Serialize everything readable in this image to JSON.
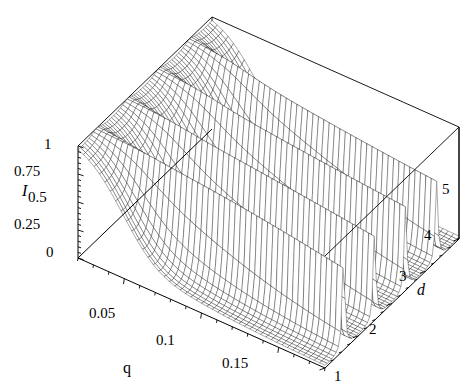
{
  "figure": {
    "type": "surface3d-wireframe",
    "background": "#ffffff",
    "line_color": "#000000",
    "fill_color": "#ffffff"
  },
  "axes": {
    "vertical": {
      "title": "I",
      "title_style": "italic",
      "ticks": [
        "0",
        "0.25",
        "0.5",
        "0.75",
        "1"
      ],
      "values": [
        0,
        0.25,
        0.5,
        0.75,
        1
      ],
      "range": [
        0,
        1
      ]
    },
    "left_depth": {
      "title": "q",
      "title_style": "upright",
      "ticks": [
        "0.05",
        "0.1",
        "0.15"
      ],
      "values": [
        0.05,
        0.1,
        0.15
      ],
      "range": [
        0.02,
        0.18
      ]
    },
    "right_depth": {
      "title": "d",
      "title_style": "italic",
      "ticks": [
        "1",
        "2",
        "3",
        "4",
        "5"
      ],
      "values": [
        1,
        2,
        3,
        4,
        5
      ],
      "range": [
        1,
        5
      ]
    }
  },
  "tick_labels": {
    "I": [
      {
        "text": "1",
        "x": 44,
        "y": 137
      },
      {
        "text": "0.75",
        "x": 14,
        "y": 164
      },
      {
        "text": "0.5",
        "x": 28,
        "y": 190
      },
      {
        "text": "0.25",
        "x": 14,
        "y": 217
      },
      {
        "text": "0",
        "x": 46,
        "y": 245
      }
    ],
    "q": [
      {
        "text": "0.05",
        "x": 89,
        "y": 306
      },
      {
        "text": "0.1",
        "x": 156,
        "y": 333
      },
      {
        "text": "0.15",
        "x": 222,
        "y": 356
      }
    ],
    "d": [
      {
        "text": "1",
        "x": 334,
        "y": 369
      },
      {
        "text": "2",
        "x": 369,
        "y": 322
      },
      {
        "text": "3",
        "x": 399,
        "y": 269
      },
      {
        "text": "4",
        "x": 424,
        "y": 228
      },
      {
        "text": "5",
        "x": 442,
        "y": 182
      }
    ]
  },
  "axis_titles": [
    {
      "name": "I",
      "text": "I",
      "x": 22,
      "y": 183,
      "italic": true
    },
    {
      "name": "q",
      "text": "q",
      "x": 123,
      "y": 360,
      "italic": false
    },
    {
      "name": "d",
      "text": "d",
      "x": 417,
      "y": 282,
      "italic": true
    }
  ],
  "chart_data": {
    "type": "surface",
    "title": "",
    "xlabel": "q",
    "ylabel": "d",
    "zlabel": "I",
    "xlim": [
      0.02,
      0.18
    ],
    "ylim": [
      1,
      5
    ],
    "zlim": [
      0,
      1
    ],
    "grid": false,
    "legend": null,
    "model": {
      "formula": "I = 1 / (1 + F*sin(pi*d/ (something))^2) style Airy resonance with q-dependent finesse",
      "finesse_scale": 1.0,
      "peak_positions_d": [
        1.55,
        2.45,
        3.38,
        4.32
      ],
      "peak_heights_I": [
        1.0,
        0.97,
        0.9,
        0.78
      ]
    },
    "samples": {
      "nq": 46,
      "nd": 60,
      "q_values_note": "uniform from 0.02 to 0.18",
      "d_values_note": "uniform from 1 to 5"
    }
  },
  "projection": {
    "origin_front_left": [
      78,
      258
    ],
    "origin_front_bottom": [
      325,
      368
    ],
    "corner_back_left": [
      212,
      17
    ],
    "corner_back_right": [
      452,
      88
    ],
    "z_top_at_origin": [
      78,
      146
    ],
    "z_bottom_at_origin": [
      78,
      258
    ]
  }
}
